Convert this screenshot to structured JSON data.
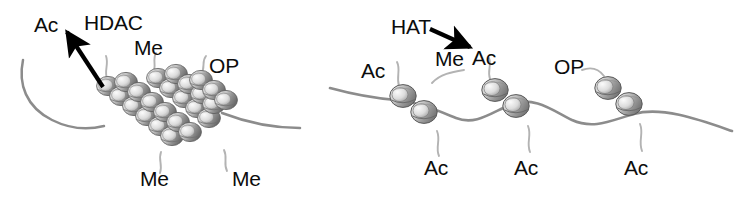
{
  "figure": {
    "background_color": "#ffffff",
    "width": 744,
    "height": 199
  },
  "colors": {
    "label_text": "#0c0c0c",
    "arrow": "#000000",
    "dna_strand": "#8c8c8c",
    "histone_tail": "#b0b0b0",
    "nucleosome_light": "#e8e8e8",
    "nucleosome_mid": "#c0c0c0",
    "nucleosome_dark": "#6f6f6f",
    "nucleosome_outline": "#5a5a5a"
  },
  "panels": {
    "left": {
      "name": "condensed-chromatin-panel",
      "enzyme": "HDAC",
      "state_description": "condensed chromatin fiber",
      "labels": [
        {
          "id": "ac-released",
          "text": "Ac",
          "x": 34,
          "y": 14
        },
        {
          "id": "hdac",
          "text": "HDAC",
          "x": 84,
          "y": 12
        },
        {
          "id": "me-top",
          "text": "Me",
          "x": 134,
          "y": 37
        },
        {
          "id": "op-top",
          "text": "OP",
          "x": 209,
          "y": 55
        },
        {
          "id": "me-bottom-1",
          "text": "Me",
          "x": 140,
          "y": 168
        },
        {
          "id": "me-bottom-2",
          "text": "Me",
          "x": 232,
          "y": 168
        }
      ],
      "arrow": {
        "id": "hdac-deacetylation-arrow",
        "direction": "up-left",
        "from_x": 103,
        "from_y": 87,
        "to_x": 64,
        "to_y": 29
      }
    },
    "right": {
      "name": "open-chromatin-panel",
      "enzyme": "HAT",
      "state_description": "open, acetylated chromatin fiber",
      "labels": [
        {
          "id": "hat",
          "text": "HAT",
          "x": 391,
          "y": 16
        },
        {
          "id": "ac-left",
          "text": "Ac",
          "x": 361,
          "y": 60
        },
        {
          "id": "me-right",
          "text": "Me",
          "x": 435,
          "y": 48
        },
        {
          "id": "ac-added",
          "text": "Ac",
          "x": 472,
          "y": 47
        },
        {
          "id": "op-right",
          "text": "OP",
          "x": 554,
          "y": 56
        },
        {
          "id": "ac-bottom-1",
          "text": "Ac",
          "x": 424,
          "y": 157
        },
        {
          "id": "ac-bottom-2",
          "text": "Ac",
          "x": 514,
          "y": 157
        },
        {
          "id": "ac-bottom-3",
          "text": "Ac",
          "x": 624,
          "y": 157
        }
      ],
      "arrow": {
        "id": "hat-acetylation-arrow",
        "direction": "down-right",
        "from_x": 432,
        "from_y": 30,
        "to_x": 471,
        "to_y": 48
      }
    }
  },
  "nucleosomes": {
    "left_panel_count": 18,
    "left_panel_arrangement": "compact chevron stack (condensed 30nm fiber)",
    "right_panel_groups": 3,
    "right_panel_per_group": 2,
    "right_panel_arrangement": "beads-on-a-string along wavy DNA"
  }
}
